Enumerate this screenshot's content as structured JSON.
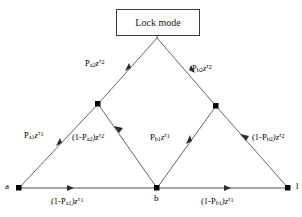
{
  "figure": {
    "type": "signal-flow-graph",
    "title_box": {
      "label": "Lock mode"
    },
    "nodes": [
      {
        "id": "a",
        "label": "a",
        "x": 19,
        "y": 188
      },
      {
        "id": "b",
        "label": "b",
        "x": 157,
        "y": 188
      },
      {
        "id": "l",
        "label": "l",
        "x": 288,
        "y": 188
      },
      {
        "id": "left_apex",
        "label": "",
        "x": 98,
        "y": 104
      },
      {
        "id": "right_apex",
        "label": "",
        "x": 216,
        "y": 106
      },
      {
        "id": "top_apex",
        "label": "",
        "x": 157,
        "y": 38
      }
    ],
    "edges": [
      {
        "name": "a-to-left-apex",
        "from": "a",
        "to": "left_apex",
        "label_parts": {
          "base": "P",
          "sub": "a1",
          "var": "z",
          "sup": "τ",
          "sup_sub": "1"
        },
        "label_text": "Pa1zτ1"
      },
      {
        "name": "left-apex-to-top",
        "from": "left_apex",
        "to": "top_apex",
        "label_parts": {
          "base": "P",
          "sub": "a2",
          "var": "z",
          "sup": "τ",
          "sup_sub": "2"
        },
        "label_text": "Pa2zτ2"
      },
      {
        "name": "left-apex-to-b",
        "from": "left_apex",
        "to": "b",
        "label_parts": {
          "base": "(1-P",
          "sub": "a2",
          "var": ")z",
          "sup": "τ",
          "sup_sub": "2"
        },
        "label_text": "(1-Pa2)zτ2"
      },
      {
        "name": "a-to-b",
        "from": "a",
        "to": "b",
        "label_parts": {
          "base": "(1-P",
          "sub": "a1",
          "var": ")z",
          "sup": "τ",
          "sup_sub": "1"
        },
        "label_text": "(1-Pa1)zτ1"
      },
      {
        "name": "b-to-right-apex",
        "from": "b",
        "to": "right_apex",
        "label_parts": {
          "base": "P",
          "sub": "b1",
          "var": "z",
          "sup": "τ",
          "sup_sub": "1"
        },
        "label_text": "Pb1zτ1"
      },
      {
        "name": "right-apex-to-top",
        "from": "right_apex",
        "to": "top_apex",
        "label_parts": {
          "base": "P",
          "sub": "b2",
          "var": "z",
          "sup": "τ",
          "sup_sub": "2"
        },
        "label_text": "Pb2zτ2"
      },
      {
        "name": "right-apex-to-l",
        "from": "right_apex",
        "to": "l",
        "label_parts": {
          "base": "(1-P",
          "sub": "b2",
          "var": ")z",
          "sup": "τ",
          "sup_sub": "2"
        },
        "label_text": "(1-Pb2)zτ2"
      },
      {
        "name": "b-to-l",
        "from": "b",
        "to": "l",
        "label_parts": {
          "base": "(1-P",
          "sub": "b1",
          "var": ")z",
          "sup": "τ",
          "sup_sub": "1"
        },
        "label_text": "(1-Pb1)zτ1"
      }
    ],
    "colors": {
      "line": "#555555",
      "node_fill": "#000000",
      "box_border": "#3a3a3a",
      "text": "#000000",
      "background": "#ffffff"
    },
    "labels": {
      "p_a1": {
        "base": "P",
        "sub": "a1",
        "tail": "z",
        "sup": "τ",
        "sup_sub": "1"
      },
      "p_a2": {
        "base": "P",
        "sub": "a2",
        "tail": "z",
        "sup": "τ",
        "sup_sub": "2"
      },
      "p_b1": {
        "base": "P",
        "sub": "b1",
        "tail": "z",
        "sup": "τ",
        "sup_sub": "1"
      },
      "p_b2": {
        "base": "P",
        "sub": "b2",
        "tail": "z",
        "sup": "τ",
        "sup_sub": "2"
      },
      "one_minus_p_a1": {
        "open": "(1-P",
        "sub": "a1",
        "close": ")z",
        "sup": "τ",
        "sup_sub": "1"
      },
      "one_minus_p_a2": {
        "open": "(1-P",
        "sub": "a2",
        "close": ")z",
        "sup": "τ",
        "sup_sub": "2"
      },
      "one_minus_p_b1": {
        "open": "(1-P",
        "sub": "b1",
        "close": ")z",
        "sup": "τ",
        "sup_sub": "1"
      },
      "one_minus_p_b2": {
        "open": "(1-P",
        "sub": "b2",
        "close": ")z",
        "sup": "τ",
        "sup_sub": "2"
      }
    },
    "node_labels": {
      "a": "a",
      "b": "b",
      "l": "l"
    }
  }
}
